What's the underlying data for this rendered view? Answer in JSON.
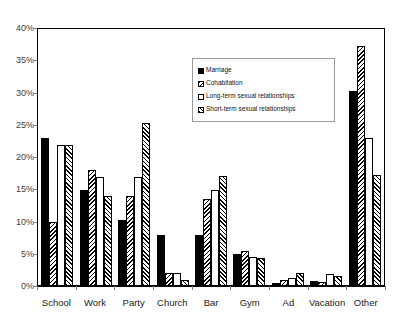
{
  "chart_data": {
    "type": "bar",
    "title": "",
    "xlabel": "",
    "ylabel": "",
    "ylim": [
      0,
      40
    ],
    "grid": false,
    "legend_position": "inside-upper-center",
    "categories": [
      "School",
      "Work",
      "Party",
      "Church",
      "Bar",
      "Gym",
      "Ad",
      "Vacation",
      "Other"
    ],
    "ytick_labels": [
      "0%",
      "5%",
      "10%",
      "15%",
      "20%",
      "25%",
      "30%",
      "35%",
      "40%"
    ],
    "ytick_values": [
      0,
      5,
      10,
      15,
      20,
      25,
      30,
      35,
      40
    ],
    "series": [
      {
        "name": "Marriage",
        "fill": "solid-black",
        "values": [
          23.0,
          15.0,
          10.2,
          8.0,
          8.0,
          5.0,
          0.5,
          0.8,
          30.4
        ]
      },
      {
        "name": "Cohabitation",
        "fill": "dense-diagonal-hatch",
        "values": [
          10.0,
          18.0,
          14.0,
          2.0,
          13.5,
          5.5,
          1.0,
          0.6,
          37.4
        ]
      },
      {
        "name": "Long-term sexual relationships",
        "fill": "white",
        "values": [
          22.0,
          17.0,
          17.0,
          2.0,
          15.0,
          4.5,
          1.3,
          1.8,
          23.0
        ]
      },
      {
        "name": "Short-term sexual relationships",
        "fill": "diagonal-hatch",
        "values": [
          22.0,
          14.0,
          25.3,
          1.0,
          17.2,
          4.3,
          2.0,
          1.5,
          17.3
        ]
      }
    ]
  }
}
